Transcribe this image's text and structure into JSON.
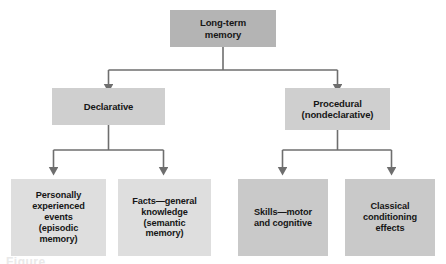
{
  "diagram": {
    "colors": {
      "root_fill": "#b4b4b4",
      "mid_fill": "#cfcfcf",
      "leaf_fill_light": "#dedede",
      "leaf_fill_dark": "#c9c9c9",
      "connector": "#6e6e6e",
      "background": "#ffffff",
      "text": "#161616"
    },
    "nodes": {
      "root": {
        "label": "Long-term\nmemory",
        "lines": [
          "Long-term",
          "memory"
        ]
      },
      "declarative": {
        "label": "Declarative",
        "lines": [
          "Declarative"
        ]
      },
      "procedural": {
        "label": "Procedural\n(nondeclarative)",
        "lines": [
          "Procedural",
          "(nondeclarative)"
        ]
      },
      "episodic": {
        "label": "Personally experienced events (episodic memory)",
        "lines": [
          "Personally",
          "experienced",
          "events",
          "(episodic",
          "memory)"
        ]
      },
      "semantic": {
        "label": "Facts—general knowledge (semantic memory)",
        "lines": [
          "Facts—general",
          "knowledge",
          "(semantic",
          "memory)"
        ]
      },
      "skills": {
        "label": "Skills—motor and cognitive",
        "lines": [
          "Skills—motor",
          "and cognitive"
        ]
      },
      "classical": {
        "label": "Classical conditioning effects",
        "lines": [
          "Classical",
          "conditioning",
          "effects"
        ]
      }
    },
    "caption": {
      "text": "Figure"
    }
  }
}
